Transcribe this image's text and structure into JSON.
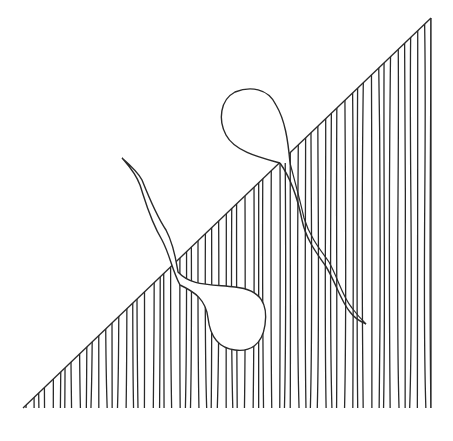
{
  "artwork": {
    "description": "Line drawing: right triangle with vertical wavy hatching and two teardrop shapes with tails",
    "colors": {
      "background": "#ffffff",
      "ink": "#2a2a2a"
    },
    "triangle": {
      "apex": [
        431,
        18
      ],
      "bottom_left": [
        23,
        408
      ],
      "bottom_right": [
        431,
        408
      ]
    },
    "hatch_count": 62,
    "shapes": [
      {
        "name": "upper-right-teardrop",
        "bulb_center": [
          255,
          118
        ],
        "tail_end": [
          366,
          324
        ]
      },
      {
        "name": "lower-left-teardrop",
        "bulb_center": [
          235,
          318
        ],
        "tail_end": [
          122,
          158
        ]
      }
    ]
  }
}
